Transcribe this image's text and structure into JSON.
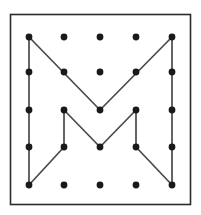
{
  "figure": {
    "canvas": {
      "width": 201,
      "height": 215,
      "background": "#ffffff"
    },
    "frame": {
      "name": "outer-border",
      "x": 10.5,
      "y": 14.5,
      "width": 180,
      "height": 190,
      "stroke": "#2b2b2b",
      "stroke_width": 1.6,
      "fill": "#ffffff"
    },
    "grid": {
      "rows": 5,
      "cols": 5,
      "x_positions": [
        29,
        64,
        100,
        136,
        172
      ],
      "y_positions": [
        37,
        72,
        110,
        147,
        185
      ],
      "dot_radius": 3.4,
      "dot_color": "#1a1a1a"
    },
    "band": {
      "stroke": "#4a4a4a",
      "stroke_width": 1.7,
      "fill": "none",
      "segments": [
        {
          "name": "left-column-vertical",
          "points": "29,37 29,185"
        },
        {
          "name": "right-column-vertical",
          "points": "172,37 172,185"
        },
        {
          "name": "upper-v-left-diagonal",
          "points": "29,37 100,110"
        },
        {
          "name": "upper-v-right-diagonal",
          "points": "100,110 172,37"
        },
        {
          "name": "inner-left-vertical",
          "points": "64,110 64,147"
        },
        {
          "name": "inner-right-vertical",
          "points": "136,110 136,147"
        },
        {
          "name": "lower-v-left-diagonal",
          "points": "64,110 100,147"
        },
        {
          "name": "lower-v-right-diagonal",
          "points": "100,147 136,110"
        },
        {
          "name": "bottom-left-diagonal",
          "points": "64,147 29,185"
        },
        {
          "name": "bottom-right-diagonal",
          "points": "136,147 172,185"
        }
      ],
      "vertices": [
        {
          "name": "vertex-top-left",
          "x": 29,
          "y": 37
        },
        {
          "name": "vertex-upper-v-bottom",
          "x": 100,
          "y": 110
        },
        {
          "name": "vertex-top-right",
          "x": 172,
          "y": 37
        },
        {
          "name": "vertex-inner-left-top",
          "x": 64,
          "y": 110
        },
        {
          "name": "vertex-inner-right-top",
          "x": 136,
          "y": 110
        },
        {
          "name": "vertex-lower-v-bottom",
          "x": 100,
          "y": 147
        },
        {
          "name": "vertex-inner-left-bottom",
          "x": 64,
          "y": 147
        },
        {
          "name": "vertex-inner-right-bottom",
          "x": 136,
          "y": 147
        },
        {
          "name": "vertex-bottom-left",
          "x": 29,
          "y": 185
        },
        {
          "name": "vertex-bottom-right",
          "x": 172,
          "y": 185
        }
      ]
    }
  }
}
